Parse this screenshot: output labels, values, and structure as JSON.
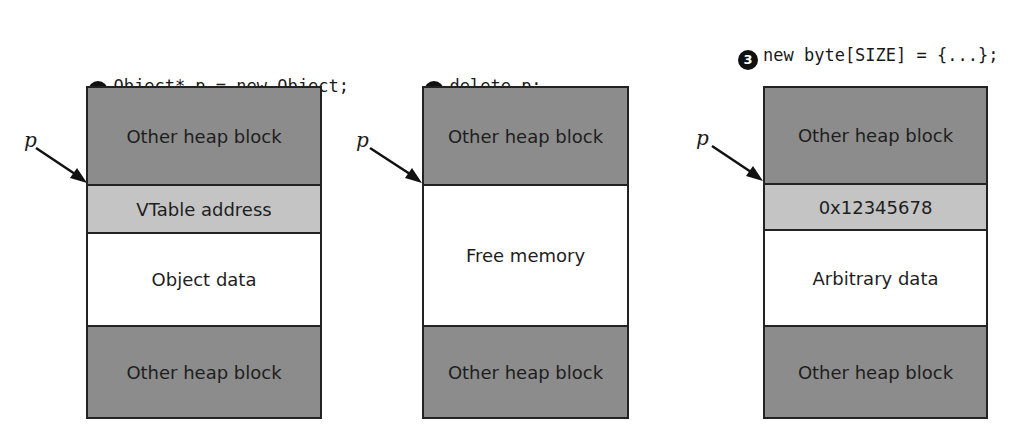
{
  "panels": [
    {
      "step_number": "1",
      "code_lines": [
        "Object* p = new Object;"
      ],
      "pointer_label": "p",
      "blocks": [
        {
          "label": "Other heap block",
          "shade": "dark"
        },
        {
          "label": "VTable address",
          "shade": "light"
        },
        {
          "label": "Object data",
          "shade": "white"
        },
        {
          "label": "Other heap block",
          "shade": "dark"
        }
      ]
    },
    {
      "step_number": "2",
      "code_lines": [
        "delete p;"
      ],
      "pointer_label": "p",
      "blocks": [
        {
          "label": "Other heap block",
          "shade": "dark"
        },
        {
          "label": "Free memory",
          "shade": "white"
        },
        {
          "label": "Other heap block",
          "shade": "dark"
        }
      ]
    },
    {
      "step_number": "3",
      "code_lines": [
        "new byte[SIZE] = {...};",
        "// Later in execution",
        "p->Func1();"
      ],
      "pointer_label": "p",
      "blocks": [
        {
          "label": "Other heap block",
          "shade": "dark"
        },
        {
          "label": "0x12345678",
          "shade": "light"
        },
        {
          "label": "Arbitrary data",
          "shade": "white"
        },
        {
          "label": "Other heap block",
          "shade": "dark"
        }
      ]
    }
  ],
  "colors": {
    "dark_block": "#8c8c8c",
    "light_block": "#c4c4c4",
    "free_block": "#ffffff",
    "outline": "#222222"
  }
}
